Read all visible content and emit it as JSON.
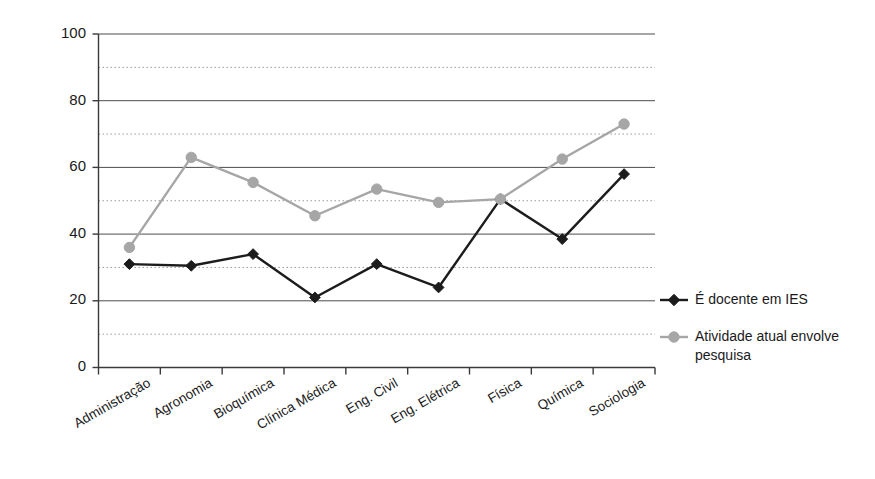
{
  "chart_data": {
    "type": "line",
    "title": "",
    "subtitle": "",
    "xlabel": "",
    "ylabel": "",
    "ylim": [
      0,
      100
    ],
    "yticks": [
      0,
      20,
      40,
      60,
      80,
      100
    ],
    "y_minor_gridlines": [
      10,
      30,
      50,
      70,
      90
    ],
    "grid": true,
    "legend_position": "right",
    "categories": [
      "Administração",
      "Agronomia",
      "Bioquímica",
      "Clínica Médica",
      "Eng. Civil",
      "Eng. Elétrica",
      "Física",
      "Química",
      "Sociologia"
    ],
    "series": [
      {
        "name": "É docente em IES",
        "color": "#1c1c1c",
        "marker": "diamond",
        "values": [
          31,
          30.5,
          34,
          21,
          31,
          24,
          50.5,
          38.5,
          58
        ]
      },
      {
        "name": "Atividade atual envolve pesquisa",
        "color": "#a6a6a6",
        "marker": "circle",
        "values": [
          36,
          63,
          55.5,
          45.5,
          53.5,
          49.5,
          50.5,
          62.5,
          73
        ]
      }
    ]
  },
  "legend": {
    "entries": [
      {
        "label": "É docente em IES"
      },
      {
        "label": "Atividade atual envolve pesquisa"
      }
    ],
    "entry_1_line_1": "É docente em IES",
    "entry_2_line_1": "Atividade atual envolve",
    "entry_2_line_2": "pesquisa"
  },
  "axis": {
    "y_tick_100": "100",
    "y_tick_80": "80",
    "y_tick_60": "60",
    "y_tick_40": "40",
    "y_tick_20": "20",
    "y_tick_0": "0"
  },
  "colors": {
    "series_a": "#1c1c1c",
    "series_b": "#a6a6a6",
    "grid_major": "#4d4d4d",
    "grid_minor": "#9a9a9a",
    "axis": "#3a3a3a",
    "background": "#ffffff"
  }
}
